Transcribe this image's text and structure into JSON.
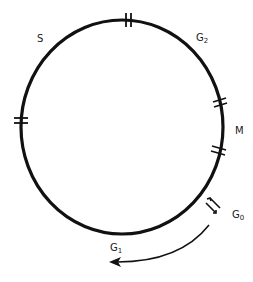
{
  "diagram": {
    "stroke_color": "#111111",
    "background": "#ffffff",
    "phases": [
      {
        "id": "S",
        "label": "S",
        "sub": ""
      },
      {
        "id": "G2",
        "label": "G",
        "sub": "2"
      },
      {
        "id": "M",
        "label": "M",
        "sub": ""
      },
      {
        "id": "G0",
        "label": "G",
        "sub": "0"
      },
      {
        "id": "G1",
        "label": "G",
        "sub": "1"
      }
    ],
    "boundary_marks": [
      "S|G2",
      "G2|M",
      "M|G1",
      "G1|S"
    ],
    "arrows": [
      "G1<->G0 reversible",
      "G0->G1 return"
    ]
  }
}
